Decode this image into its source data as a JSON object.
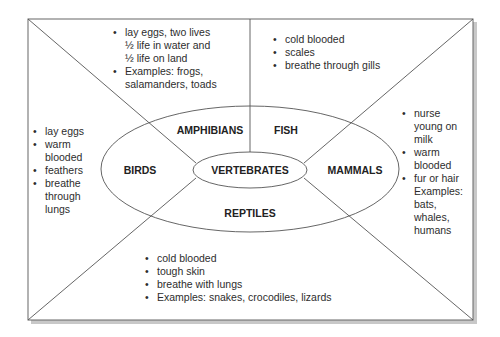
{
  "diagram": {
    "center": "VERTEBRATES",
    "groups": {
      "amphibians": {
        "label": "AMPHIBIANS",
        "facts": [
          {
            "text": "lay eggs, two lives",
            "bullet": true
          },
          {
            "text": "½ life in water and",
            "bullet": false
          },
          {
            "text": "½ life on land",
            "bullet": false
          },
          {
            "text": "Examples: frogs,",
            "bullet": true
          },
          {
            "text": "salamanders, toads",
            "bullet": false
          }
        ]
      },
      "fish": {
        "label": "FISH",
        "facts": [
          {
            "text": "cold blooded",
            "bullet": true
          },
          {
            "text": "scales",
            "bullet": true
          },
          {
            "text": "breathe through gills",
            "bullet": true
          }
        ]
      },
      "birds": {
        "label": "BIRDS",
        "facts": [
          {
            "text": "lay eggs",
            "bullet": true
          },
          {
            "text": "warm",
            "bullet": true
          },
          {
            "text": "blooded",
            "bullet": false
          },
          {
            "text": "feathers",
            "bullet": true
          },
          {
            "text": "breathe",
            "bullet": true
          },
          {
            "text": "through",
            "bullet": false
          },
          {
            "text": "lungs",
            "bullet": false
          }
        ]
      },
      "mammals": {
        "label": "MAMMALS",
        "facts": [
          {
            "text": "nurse",
            "bullet": true
          },
          {
            "text": "young on",
            "bullet": false
          },
          {
            "text": "milk",
            "bullet": false
          },
          {
            "text": "warm",
            "bullet": true
          },
          {
            "text": "blooded",
            "bullet": false
          },
          {
            "text": "fur or hair",
            "bullet": true
          },
          {
            "text": "Examples:",
            "bullet": false
          },
          {
            "text": "bats,",
            "bullet": false
          },
          {
            "text": "whales,",
            "bullet": false
          },
          {
            "text": "humans",
            "bullet": false
          }
        ]
      },
      "reptiles": {
        "label": "REPTILES",
        "facts": [
          {
            "text": "cold blooded",
            "bullet": true
          },
          {
            "text": "tough skin",
            "bullet": true
          },
          {
            "text": "breathe with lungs",
            "bullet": true
          },
          {
            "text": "Examples: snakes, crocodiles, lizards",
            "bullet": true
          }
        ]
      }
    },
    "colors": {
      "line": "#555555",
      "text": "#2d2d2d",
      "shadow": "#bdbdbd",
      "background": "#ffffff"
    }
  }
}
